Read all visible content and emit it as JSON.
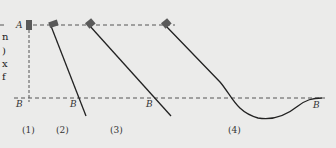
{
  "diagram": {
    "point_labels": {
      "start": "A",
      "end": "B"
    },
    "cases": [
      {
        "id": "case-1",
        "caption": "(1)",
        "path": "vertical-drop"
      },
      {
        "id": "case-2",
        "caption": "(2)",
        "path": "steep-incline"
      },
      {
        "id": "case-3",
        "caption": "(3)",
        "path": "shallow-incline"
      },
      {
        "id": "case-4",
        "caption": "(4)",
        "path": "curved-dip"
      }
    ],
    "edge_text": [
      "n",
      ")",
      "x",
      "f"
    ],
    "colors": {
      "line": "#222222",
      "dash": "#555555",
      "block": "#5a5a5a",
      "background": "#ebebea"
    }
  }
}
